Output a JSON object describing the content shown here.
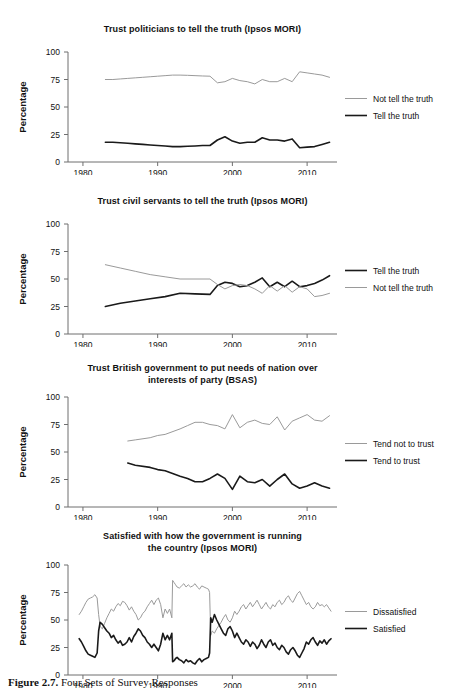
{
  "figure": {
    "caption_label": "Figure 2.7.",
    "caption_text": "Four Sets of Survey Responses"
  },
  "style": {
    "dark_color": "#1a1a1a",
    "light_color": "#9a9a9a",
    "axis_color": "#6f6f6f",
    "dark_width": 1.6,
    "light_width": 1.0
  },
  "chart_data": [
    {
      "type": "line",
      "title": "Trust politicians to tell the truth (Ipsos MORI)",
      "xlabel": "",
      "ylabel": "Percentage",
      "ylim": [
        0,
        100
      ],
      "xlim": [
        1978,
        2014
      ],
      "yticks": [
        0,
        25,
        50,
        75,
        100
      ],
      "xticks": [
        1980,
        1990,
        2000,
        2010
      ],
      "grid": false,
      "legend_position": "right",
      "series": [
        {
          "name": "Not tell the truth",
          "color_role": "light",
          "x": [
            1983,
            1984,
            1985,
            1986,
            1987,
            1988,
            1989,
            1990,
            1991,
            1992,
            1993,
            1994,
            1995,
            1996,
            1997,
            1998,
            1999,
            2000,
            2001,
            2002,
            2003,
            2004,
            2005,
            2006,
            2007,
            2008,
            2009,
            2010,
            2011,
            2012,
            2013
          ],
          "values": [
            75,
            75,
            75.5,
            76,
            76.5,
            77,
            77.5,
            78,
            78.5,
            79,
            79,
            78.8,
            78.5,
            78.2,
            78,
            72,
            73,
            76,
            74,
            73,
            71,
            75,
            73,
            73,
            76,
            73,
            82,
            81,
            80,
            79,
            77
          ]
        },
        {
          "name": "Tell the truth",
          "color_role": "dark",
          "x": [
            1983,
            1984,
            1985,
            1986,
            1987,
            1988,
            1989,
            1990,
            1991,
            1992,
            1993,
            1994,
            1995,
            1996,
            1997,
            1998,
            1999,
            2000,
            2001,
            2002,
            2003,
            2004,
            2005,
            2006,
            2007,
            2008,
            2009,
            2010,
            2011,
            2012,
            2013
          ],
          "values": [
            18,
            18,
            17.5,
            17,
            16.5,
            16,
            15.5,
            15,
            14.5,
            14,
            14,
            14.3,
            14.6,
            15,
            15,
            20,
            23,
            19,
            17,
            18,
            18,
            22,
            20,
            20,
            19,
            21,
            13,
            13.5,
            14,
            16,
            18
          ]
        }
      ]
    },
    {
      "type": "line",
      "title": "Trust civil servants to tell the truth (Ipsos MORI)",
      "xlabel": "",
      "ylabel": "Percentage",
      "ylim": [
        0,
        100
      ],
      "xlim": [
        1978,
        2014
      ],
      "yticks": [
        0,
        25,
        50,
        75,
        100
      ],
      "xticks": [
        1980,
        1990,
        2000,
        2010
      ],
      "grid": false,
      "legend_position": "right",
      "series": [
        {
          "name": "Tell the truth",
          "color_role": "dark",
          "x": [
            1983,
            1985,
            1987,
            1989,
            1991,
            1993,
            1995,
            1997,
            1998,
            1999,
            2000,
            2001,
            2002,
            2003,
            2004,
            2005,
            2006,
            2007,
            2008,
            2009,
            2010,
            2011,
            2012,
            2013
          ],
          "values": [
            25,
            28,
            30,
            32,
            34,
            37,
            36.5,
            36,
            44,
            47,
            46,
            43,
            44,
            47,
            51,
            43,
            47,
            43,
            48,
            43,
            44,
            46,
            49,
            53
          ]
        },
        {
          "name": "Not tell the truth",
          "color_role": "light",
          "x": [
            1983,
            1985,
            1987,
            1989,
            1991,
            1993,
            1995,
            1997,
            1998,
            1999,
            2000,
            2001,
            2002,
            2003,
            2004,
            2005,
            2006,
            2007,
            2008,
            2009,
            2010,
            2011,
            2012,
            2013
          ],
          "values": [
            63,
            60,
            57,
            54,
            52,
            50,
            50,
            50,
            45,
            41,
            44,
            45,
            44,
            41,
            37,
            44,
            39,
            44,
            38,
            43,
            41,
            34,
            35,
            37
          ]
        }
      ]
    },
    {
      "type": "line",
      "title": "Trust British government to put needs of nation over interests of party (BSAS)",
      "title_line1": "Trust British government to put needs of nation over",
      "title_line2": "interests of party (BSAS)",
      "xlabel": "",
      "ylabel": "Percentage",
      "ylim": [
        0,
        100
      ],
      "xlim": [
        1978,
        2014
      ],
      "yticks": [
        0,
        25,
        50,
        75,
        100
      ],
      "xticks": [
        1980,
        1990,
        2000,
        2010
      ],
      "grid": false,
      "legend_position": "right",
      "series": [
        {
          "name": "Tend not to trust",
          "color_role": "light",
          "x": [
            1986,
            1987,
            1989,
            1990,
            1991,
            1993,
            1994,
            1995,
            1996,
            1997,
            1998,
            1999,
            2000,
            2001,
            2002,
            2003,
            2004,
            2005,
            2006,
            2007,
            2008,
            2009,
            2010,
            2011,
            2012,
            2013
          ],
          "values": [
            60,
            61,
            63,
            65,
            66,
            71,
            74,
            77,
            77,
            75,
            74,
            71,
            84,
            72,
            77,
            79,
            76,
            75,
            82,
            70,
            78,
            81,
            84,
            79,
            78,
            83
          ]
        },
        {
          "name": "Tend to trust",
          "color_role": "dark",
          "x": [
            1986,
            1987,
            1989,
            1990,
            1991,
            1993,
            1994,
            1995,
            1996,
            1997,
            1998,
            1999,
            2000,
            2001,
            2002,
            2003,
            2004,
            2005,
            2006,
            2007,
            2008,
            2009,
            2010,
            2011,
            2012,
            2013
          ],
          "values": [
            40,
            38,
            36,
            34,
            33,
            28,
            26,
            23,
            23,
            26,
            30,
            26,
            16,
            28,
            23,
            22,
            25,
            19,
            25,
            30,
            21,
            17,
            19,
            22,
            19,
            17
          ]
        }
      ]
    },
    {
      "type": "line",
      "title": "Satisfied with how the government is running the country (Ipsos MORI)",
      "title_line1": "Satisfied with how the government is running",
      "title_line2": "the country (Ipsos MORI)",
      "xlabel": "",
      "ylabel": "Percentage",
      "ylim": [
        0,
        100
      ],
      "xlim": [
        1978,
        2014
      ],
      "yticks": [
        0,
        25,
        50,
        75,
        100
      ],
      "xticks": [
        1980,
        1990,
        2000,
        2010
      ],
      "grid": false,
      "legend_position": "right",
      "series": [
        {
          "name": "Dissatisfied",
          "color_role": "light",
          "x": [
            1979.5,
            1979.8,
            1980.1,
            1980.4,
            1980.7,
            1981.0,
            1981.3,
            1981.6,
            1981.9,
            1982.1,
            1982.3,
            1982.6,
            1982.9,
            1983.2,
            1983.5,
            1983.8,
            1984.1,
            1984.4,
            1984.7,
            1985.0,
            1985.3,
            1985.6,
            1985.9,
            1986.2,
            1986.5,
            1986.8,
            1987.1,
            1987.4,
            1987.7,
            1988.0,
            1988.3,
            1988.6,
            1988.9,
            1989.2,
            1989.5,
            1989.8,
            1990.1,
            1990.4,
            1990.7,
            1991.0,
            1991.3,
            1991.6,
            1991.9,
            1992.0,
            1992.2,
            1992.4,
            1992.6,
            1992.9,
            1993.2,
            1993.5,
            1993.8,
            1994.1,
            1994.4,
            1994.7,
            1995.0,
            1995.3,
            1995.6,
            1995.9,
            1996.2,
            1996.5,
            1996.8,
            1996.95,
            1997.1,
            1997.3,
            1997.6,
            1997.9,
            1998.2,
            1998.5,
            1998.8,
            1999.1,
            1999.4,
            1999.7,
            2000.0,
            2000.3,
            2000.6,
            2000.9,
            2001.2,
            2001.5,
            2001.8,
            2002.1,
            2002.4,
            2002.7,
            2003.0,
            2003.3,
            2003.6,
            2003.9,
            2004.2,
            2004.5,
            2004.8,
            2005.1,
            2005.4,
            2005.7,
            2006.0,
            2006.3,
            2006.6,
            2006.9,
            2007.2,
            2007.5,
            2007.8,
            2008.1,
            2008.4,
            2008.7,
            2009.0,
            2009.3,
            2009.6,
            2009.9,
            2010.2,
            2010.5,
            2010.8,
            2011.1,
            2011.4,
            2011.7,
            2012.0,
            2012.3,
            2012.6,
            2012.9,
            2013.2
          ],
          "values": [
            55,
            58,
            62,
            66,
            69,
            70,
            71,
            73,
            70,
            55,
            44,
            42,
            47,
            52,
            56,
            60,
            58,
            62,
            65,
            63,
            67,
            66,
            63,
            59,
            62,
            58,
            55,
            50,
            52,
            56,
            58,
            62,
            65,
            68,
            64,
            68,
            70,
            64,
            52,
            60,
            56,
            60,
            52,
            86,
            84,
            82,
            80,
            79,
            81,
            83,
            80,
            82,
            80,
            81,
            83,
            80,
            78,
            81,
            80,
            79,
            78,
            75,
            36,
            40,
            38,
            42,
            45,
            48,
            52,
            55,
            50,
            48,
            52,
            58,
            55,
            58,
            62,
            64,
            60,
            63,
            66,
            62,
            65,
            68,
            64,
            60,
            63,
            66,
            62,
            60,
            64,
            62,
            66,
            68,
            64,
            66,
            70,
            72,
            68,
            66,
            70,
            74,
            76,
            72,
            68,
            64,
            66,
            62,
            60,
            62,
            66,
            63,
            64,
            62,
            64,
            61,
            58
          ]
        },
        {
          "name": "Satisfied",
          "color_role": "dark",
          "x": [
            1979.5,
            1979.8,
            1980.1,
            1980.4,
            1980.7,
            1981.0,
            1981.3,
            1981.6,
            1981.9,
            1982.1,
            1982.3,
            1982.6,
            1982.9,
            1983.2,
            1983.5,
            1983.8,
            1984.1,
            1984.4,
            1984.7,
            1985.0,
            1985.3,
            1985.6,
            1985.9,
            1986.2,
            1986.5,
            1986.8,
            1987.1,
            1987.4,
            1987.7,
            1988.0,
            1988.3,
            1988.6,
            1988.9,
            1989.2,
            1989.5,
            1989.8,
            1990.1,
            1990.4,
            1990.7,
            1991.0,
            1991.3,
            1991.6,
            1991.9,
            1992.0,
            1992.2,
            1992.4,
            1992.6,
            1992.9,
            1993.2,
            1993.5,
            1993.8,
            1994.1,
            1994.4,
            1994.7,
            1995.0,
            1995.3,
            1995.6,
            1995.9,
            1996.2,
            1996.5,
            1996.8,
            1996.95,
            1997.1,
            1997.3,
            1997.6,
            1997.9,
            1998.2,
            1998.5,
            1998.8,
            1999.1,
            1999.4,
            1999.7,
            2000.0,
            2000.3,
            2000.6,
            2000.9,
            2001.2,
            2001.5,
            2001.8,
            2002.1,
            2002.4,
            2002.7,
            2003.0,
            2003.3,
            2003.6,
            2003.9,
            2004.2,
            2004.5,
            2004.8,
            2005.1,
            2005.4,
            2005.7,
            2006.0,
            2006.3,
            2006.6,
            2006.9,
            2007.2,
            2007.5,
            2007.8,
            2008.1,
            2008.4,
            2008.7,
            2009.0,
            2009.3,
            2009.6,
            2009.9,
            2010.2,
            2010.5,
            2010.8,
            2011.1,
            2011.4,
            2011.7,
            2012.0,
            2012.3,
            2012.6,
            2012.9,
            2013.2
          ],
          "values": [
            33,
            30,
            26,
            22,
            19,
            18,
            17,
            16,
            20,
            40,
            48,
            46,
            43,
            40,
            38,
            34,
            36,
            32,
            29,
            31,
            27,
            28,
            30,
            34,
            30,
            35,
            38,
            42,
            40,
            36,
            34,
            30,
            28,
            25,
            28,
            25,
            22,
            28,
            38,
            32,
            36,
            32,
            38,
            12,
            13,
            15,
            16,
            14,
            13,
            11,
            14,
            12,
            13,
            11,
            10,
            13,
            15,
            12,
            14,
            15,
            16,
            20,
            52,
            48,
            55,
            50,
            46,
            42,
            38,
            36,
            42,
            44,
            40,
            34,
            38,
            34,
            30,
            28,
            32,
            30,
            26,
            30,
            28,
            24,
            27,
            32,
            28,
            25,
            30,
            32,
            27,
            29,
            25,
            23,
            27,
            25,
            21,
            19,
            23,
            25,
            22,
            18,
            16,
            20,
            24,
            30,
            28,
            32,
            34,
            30,
            27,
            31,
            29,
            32,
            28,
            31,
            33
          ]
        }
      ]
    }
  ]
}
